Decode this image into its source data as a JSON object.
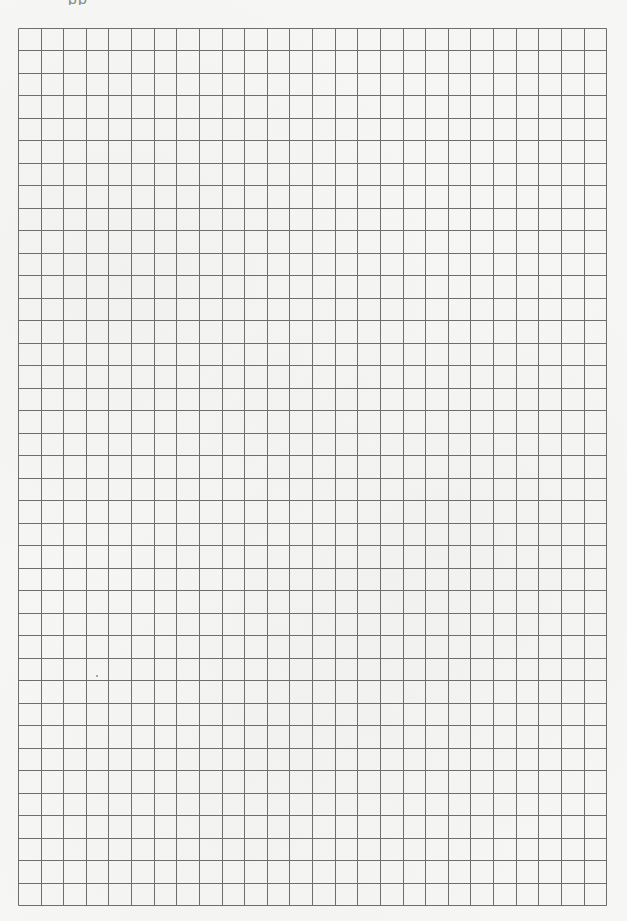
{
  "page": {
    "type": "graph-paper",
    "background_color": "#f6f6f5",
    "line_color": "#6e6e6e"
  },
  "header": {
    "clipped_text_fragment": "pp"
  },
  "grid": {
    "columns": 26,
    "rows": 39,
    "origin_x": 19,
    "origin_y": 29,
    "cell_width": 22.62,
    "cell_height": 22.49,
    "line_width": 1
  },
  "artifacts": [
    {
      "type": "scan-dot",
      "x": 96,
      "y": 675
    }
  ]
}
